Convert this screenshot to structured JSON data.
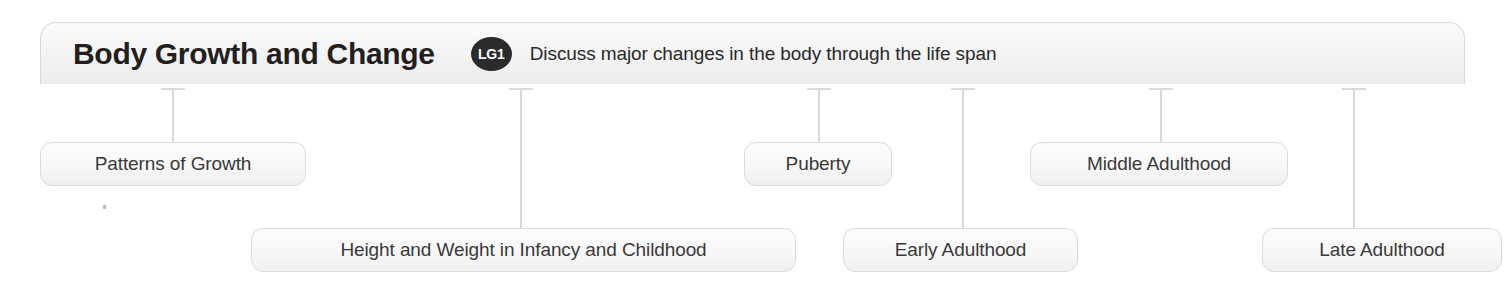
{
  "header": {
    "title": "Body Growth and Change",
    "badge": "LG1",
    "description": "Discuss major changes in the body through the life span"
  },
  "nodes": [
    {
      "label": "Patterns of Growth",
      "left": 40,
      "top": 142,
      "width": 266,
      "connector_x": 172,
      "connector_top": 88,
      "connector_height": 54
    },
    {
      "label": "Height and Weight in Infancy and Childhood",
      "left": 251,
      "top": 228,
      "width": 545,
      "connector_x": 520,
      "connector_top": 88,
      "connector_height": 140
    },
    {
      "label": "Puberty",
      "left": 744,
      "top": 142,
      "width": 148,
      "connector_x": 818,
      "connector_top": 88,
      "connector_height": 54
    },
    {
      "label": "Early Adulthood",
      "left": 843,
      "top": 228,
      "width": 235,
      "connector_x": 962,
      "connector_top": 88,
      "connector_height": 140
    },
    {
      "label": "Middle Adulthood",
      "left": 1030,
      "top": 142,
      "width": 258,
      "connector_x": 1160,
      "connector_top": 88,
      "connector_height": 54
    },
    {
      "label": "Late Adulthood",
      "left": 1262,
      "top": 228,
      "width": 240,
      "connector_x": 1353,
      "connector_top": 88,
      "connector_height": 140
    }
  ],
  "colors": {
    "header_border": "#d8d8d8",
    "pill_border": "#dadada",
    "connector": "#d9d9d9",
    "badge_bg": "#2b2b2b",
    "title_text": "#231f20",
    "pill_text": "#3a3a3a"
  }
}
